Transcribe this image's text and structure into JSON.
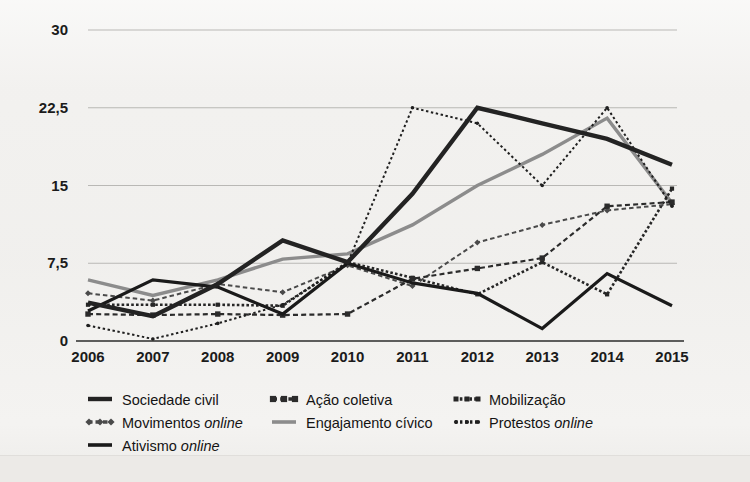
{
  "chart_data": {
    "type": "line",
    "title": "",
    "subtitle": "",
    "xlabel": "",
    "ylabel": "",
    "x": [
      "2006",
      "2007",
      "2008",
      "2009",
      "2010",
      "2011",
      "2012",
      "2013",
      "2014",
      "2015"
    ],
    "categories": [
      "2006",
      "2007",
      "2008",
      "2009",
      "2010",
      "2011",
      "2012",
      "2013",
      "2014",
      "2015"
    ],
    "yticks": [
      "0",
      "7,5",
      "15",
      "22,5",
      "30"
    ],
    "ytick_values": [
      0,
      7.5,
      15,
      22.5,
      30
    ],
    "ylim": [
      0,
      30
    ],
    "grid": "horizontal",
    "legend_position": "bottom",
    "series": [
      {
        "name": "Sociedade civil",
        "style": "solid-thick",
        "color": "#232323",
        "values": [
          3.7,
          2.4,
          5.5,
          9.7,
          7.6,
          14.2,
          22.5,
          21.0,
          19.5,
          17.0
        ]
      },
      {
        "name": "Ação coletiva",
        "style": "dashed-square",
        "color": "#2b2b2b",
        "values": [
          2.6,
          2.5,
          2.6,
          2.5,
          2.6,
          6.0,
          7.0,
          8.0,
          13.0,
          13.4
        ]
      },
      {
        "name": "Mobilização",
        "style": "dotted-dense",
        "color": "#262626",
        "values": [
          3.5,
          3.5,
          3.5,
          3.4,
          7.6,
          6.1,
          4.5,
          7.6,
          4.5,
          14.7
        ]
      },
      {
        "name": "Movimentos online",
        "style": "dashed-diamond",
        "color": "#4a4a4a",
        "values": [
          4.6,
          3.9,
          5.5,
          4.7,
          7.3,
          5.3,
          9.5,
          11.2,
          12.6,
          13.2
        ]
      },
      {
        "name": "Engajamento cívico",
        "style": "solid-gray",
        "color": "#8c8c8c",
        "values": [
          5.9,
          4.4,
          5.9,
          7.9,
          8.4,
          11.2,
          15.0,
          18.0,
          21.5,
          13.3
        ]
      },
      {
        "name": "Protestos online",
        "style": "dotted-round",
        "color": "#1f1f1f",
        "values": [
          1.5,
          0.2,
          1.7,
          3.5,
          7.5,
          22.5,
          21.0,
          15.0,
          22.5,
          13.0
        ]
      },
      {
        "name": "Ativismo online",
        "style": "solid-dark",
        "color": "#1a1a1a",
        "values": [
          2.9,
          5.9,
          5.2,
          2.6,
          7.5,
          5.6,
          4.6,
          1.2,
          6.5,
          3.4
        ]
      }
    ],
    "legend": [
      {
        "label": "Sociedade civil",
        "italic_word": "",
        "marker": "solid-thick",
        "color": "#232323"
      },
      {
        "label": "Ação coletiva",
        "italic_word": "",
        "marker": "dashed-square",
        "color": "#2b2b2b"
      },
      {
        "label": "Mobilização",
        "italic_word": "",
        "marker": "dotted-dense",
        "color": "#262626"
      },
      {
        "label": "Movimentos",
        "italic_word": "online",
        "marker": "dashed-diamond",
        "color": "#4a4a4a"
      },
      {
        "label": "Engajamento cívico",
        "italic_word": "",
        "marker": "solid-gray",
        "color": "#8c8c8c"
      },
      {
        "label": "Protestos",
        "italic_word": "online",
        "marker": "dotted-round",
        "color": "#1f1f1f"
      },
      {
        "label": "Ativismo",
        "italic_word": "online",
        "marker": "solid-dark",
        "color": "#1a1a1a"
      }
    ]
  }
}
